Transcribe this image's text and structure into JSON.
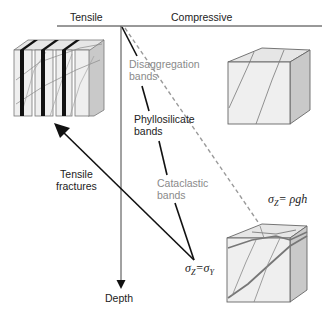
{
  "axes": {
    "top_left_label": "Tensile",
    "top_right_label": "Compressive",
    "vertical_label": "Depth"
  },
  "bands": [
    {
      "line1": "Disaggregation",
      "line2": "bands",
      "color": "#8a8a8a"
    },
    {
      "line1": "Phyllosilicate",
      "line2": "bands",
      "color": "#222222"
    },
    {
      "line1": "Cataclastic",
      "line2": "bands",
      "color": "#8a8a8a"
    }
  ],
  "fractures": {
    "line1": "Tensile",
    "line2": "fractures"
  },
  "equations": {
    "lithostatic": {
      "lhs": "σ",
      "lhs_sub": "Z",
      "rhs": "= ρgh"
    },
    "yield": {
      "lhs": "σ",
      "lhs_sub": "Z",
      "eq": "=",
      "rhs": "σ",
      "rhs_sub": "Y"
    }
  },
  "blocks": [
    {
      "name": "tensile-fractured-block",
      "position": "top-left"
    },
    {
      "name": "disaggregation-banded-cube",
      "position": "top-right"
    },
    {
      "name": "cataclastic-banded-cube",
      "position": "bottom-right"
    }
  ],
  "colors": {
    "line": "#111111",
    "dashed": "#9a9a9a",
    "block_face": "#efefef",
    "block_side": "#c9c9c9",
    "block_top": "#e3e3e3",
    "band_dark": "#111111"
  }
}
